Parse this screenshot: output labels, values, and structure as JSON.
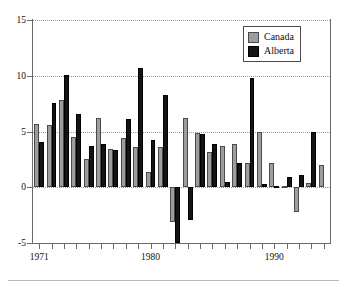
{
  "chart_data": {
    "type": "bar",
    "title": "",
    "subtitle": "",
    "xlabel": "",
    "ylabel": "",
    "ylim": [
      -5,
      15
    ],
    "yticks": [
      -5,
      0,
      5,
      10,
      15
    ],
    "ytick_labels": [
      "-5",
      "0",
      "5",
      "10",
      "15"
    ],
    "grid": true,
    "grid_axis": "y",
    "grid_style": "dotted",
    "legend_position": "top-right",
    "categories": [
      "1971",
      "1972",
      "1973",
      "1974",
      "1975",
      "1976",
      "1977",
      "1978",
      "1979",
      "1980",
      "1981",
      "1982",
      "1983",
      "1984",
      "1985",
      "1986",
      "1987",
      "1988",
      "1989",
      "1990",
      "1991",
      "1992",
      "1993",
      "1994"
    ],
    "xtick_labels": [
      "1971",
      "1980",
      "1990"
    ],
    "xtick_label_positions": [
      0,
      9,
      19
    ],
    "series": [
      {
        "name": "Canada",
        "color": "#9d9d9d",
        "edge_color": "#4a4a4a",
        "values": [
          5.7,
          5.6,
          7.8,
          4.5,
          2.5,
          6.2,
          3.4,
          4.4,
          3.6,
          1.4,
          3.6,
          -3.1,
          6.2,
          4.9,
          3.2,
          3.7,
          3.9,
          2.2,
          5.0,
          2.2,
          0.1,
          -2.2,
          0.4,
          2.0
        ]
      },
      {
        "name": "Alberta",
        "color": "#141414",
        "edge_color": "#000000",
        "values": [
          4.1,
          7.6,
          10.1,
          6.6,
          3.7,
          3.9,
          3.3,
          6.1,
          10.7,
          4.2,
          8.3,
          -5.0,
          -2.9,
          4.8,
          3.9,
          0.5,
          2.2,
          9.8,
          0.3,
          0.1,
          0.9,
          1.1,
          5.0,
          0.0
        ]
      }
    ]
  },
  "legend": {
    "items": [
      {
        "label": "Canada",
        "swatch": "canada"
      },
      {
        "label": "Alberta",
        "swatch": "alberta"
      }
    ]
  }
}
